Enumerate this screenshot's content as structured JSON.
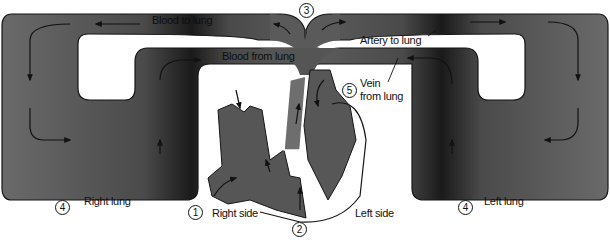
{
  "diagram": {
    "colors": {
      "vessel": "#5c5c5c",
      "vessel_dark": "#1f1f1f",
      "outline": "#151515",
      "background": "#ffffff",
      "heart": "#565656"
    },
    "labels": {
      "blood_to_lung": "Blood to lung",
      "blood_from_lung": "Blood from lung",
      "artery_to_lung": "Artery to lung",
      "vein_from_lung_line1": "Vein",
      "vein_from_lung_line2": "from lung",
      "right_lung": "Right lung",
      "left_lung": "Left lung",
      "right_side": "Right side",
      "left_side": "Left side"
    },
    "markers": {
      "m1": "1",
      "m2": "2",
      "m3": "3",
      "m4_right": "4",
      "m4_left": "4",
      "m5": "5"
    }
  }
}
